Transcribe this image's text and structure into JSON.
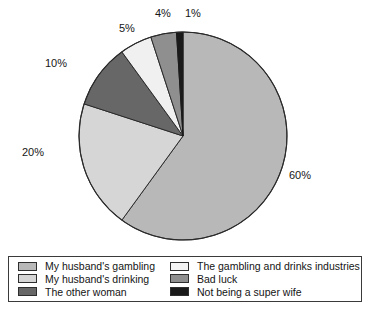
{
  "chart_data": {
    "type": "pie",
    "title": "",
    "subtitle": "",
    "xlabel": "",
    "ylabel": "",
    "legend_position": "bottom",
    "grid": false,
    "categories": [
      "My husband's gambling",
      "My husband's drinking",
      "The other woman",
      "The gambling and drinks industries",
      "Bad luck",
      "Not being a super wife"
    ],
    "values": [
      60,
      20,
      10,
      5,
      4,
      1
    ],
    "value_labels": [
      "60%",
      "20%",
      "10%",
      "5%",
      "4%",
      "1%"
    ],
    "colors": [
      "#b8b8b8",
      "#d6d6d6",
      "#676767",
      "#f0f0f0",
      "#8f8f8f",
      "#1a1a1a"
    ],
    "slices": [
      {
        "label": "My husband's gambling",
        "value": 60,
        "display": "60%",
        "color": "#b8b8b8"
      },
      {
        "label": "My husband's drinking",
        "value": 20,
        "display": "20%",
        "color": "#d6d6d6"
      },
      {
        "label": "The other woman",
        "value": 10,
        "display": "10%",
        "color": "#676767"
      },
      {
        "label": "The gambling and drinks industries",
        "value": 5,
        "display": "5%",
        "color": "#f0f0f0"
      },
      {
        "label": "Bad luck",
        "value": 4,
        "display": "4%",
        "color": "#8f8f8f"
      },
      {
        "label": "Not being a super wife",
        "value": 1,
        "display": "1%",
        "color": "#1a1a1a"
      }
    ]
  },
  "legend": {
    "column_left": [
      {
        "label": "My husband's gambling",
        "color": "#b8b8b8"
      },
      {
        "label": "My husband's drinking",
        "color": "#d6d6d6"
      },
      {
        "label": "The other woman",
        "color": "#676767"
      }
    ],
    "column_right": [
      {
        "label": "The gambling and drinks industries",
        "color": "#f4f4f4"
      },
      {
        "label": "Bad luck",
        "color": "#8f8f8f"
      },
      {
        "label": "Not being a super wife",
        "color": "#1a1a1a"
      }
    ]
  },
  "labels": {
    "pct_60": "60%",
    "pct_20": "20%",
    "pct_10": "10%",
    "pct_5": "5%",
    "pct_4": "4%",
    "pct_1": "1%"
  }
}
